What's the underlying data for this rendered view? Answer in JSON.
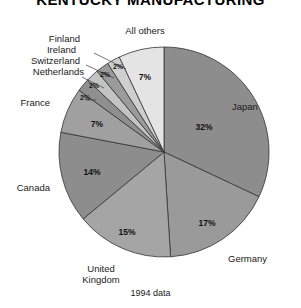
{
  "title": "KENTUCKY MANUFACTURING",
  "footnote": "1994 data",
  "chart_data": {
    "type": "pie",
    "title": "KENTUCKY MANUFACTURING",
    "subtitle": "1994 data",
    "xlabel": "",
    "ylabel": "",
    "legend": "labels placed around pie with leader lines",
    "grid": false,
    "start_angle_deg": 0,
    "direction": "clockwise",
    "categories": [
      "Japan",
      "Germany",
      "United Kingdom",
      "Canada",
      "France",
      "Netherlands",
      "Switzerland",
      "Ireland",
      "Finland",
      "All others"
    ],
    "values": [
      32,
      17,
      15,
      14,
      7,
      2,
      2,
      2,
      2,
      7
    ],
    "value_labels": [
      "32%",
      "17%",
      "15%",
      "14%",
      "7%",
      "2%",
      "2%",
      "2%",
      "2%",
      "7%"
    ],
    "colors": [
      "#8d8d8d",
      "#9a9a9a",
      "#a5a5a5",
      "#8d8d8d",
      "#a0a0a0",
      "#8f8f8f",
      "#c3c3c3",
      "#9b9b9b",
      "#cfcfcf",
      "#e4e4e4"
    ],
    "units": "percent"
  },
  "slices": [
    {
      "name": "Japan",
      "label": "Japan",
      "pct": "32%",
      "value": 32,
      "color": "#8d8d8d"
    },
    {
      "name": "Germany",
      "label": "Germany",
      "pct": "17%",
      "value": 17,
      "color": "#9a9a9a"
    },
    {
      "name": "United Kingdom",
      "label": "United\nKingdom",
      "pct": "15%",
      "value": 15,
      "color": "#a5a5a5"
    },
    {
      "name": "Canada",
      "label": "Canada",
      "pct": "14%",
      "value": 14,
      "color": "#8d8d8d"
    },
    {
      "name": "France",
      "label": "France",
      "pct": "7%",
      "value": 7,
      "color": "#a0a0a0"
    },
    {
      "name": "Netherlands",
      "label": "Netherlands",
      "pct": "2%",
      "value": 2,
      "color": "#8f8f8f"
    },
    {
      "name": "Switzerland",
      "label": "Switzerland",
      "pct": "2%",
      "value": 2,
      "color": "#c3c3c3"
    },
    {
      "name": "Ireland",
      "label": "Ireland",
      "pct": "2%",
      "value": 2,
      "color": "#9b9b9b"
    },
    {
      "name": "Finland",
      "label": "Finland",
      "pct": "2%",
      "value": 2,
      "color": "#cfcfcf"
    },
    {
      "name": "All others",
      "label": "All others",
      "pct": "7%",
      "value": 7,
      "color": "#e4e4e4"
    }
  ],
  "labels": {
    "japan": "Japan",
    "germany": "Germany",
    "united_kingdom_line1": "United",
    "united_kingdom_line2": "Kingdom",
    "canada": "Canada",
    "france": "France",
    "netherlands": "Netherlands",
    "switzerland": "Switzerland",
    "ireland": "Ireland",
    "finland": "Finland",
    "all_others": "All others"
  },
  "percents": {
    "japan": "32%",
    "germany": "17%",
    "united_kingdom": "15%",
    "canada": "14%",
    "france": "7%",
    "netherlands": "2%",
    "switzerland": "2%",
    "ireland": "2%",
    "finland": "2%",
    "all_others": "7%"
  }
}
